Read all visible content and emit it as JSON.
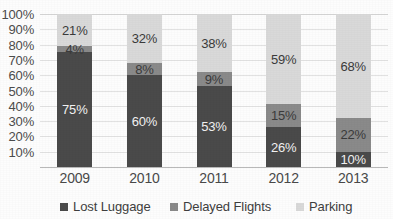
{
  "chart_data": {
    "type": "bar",
    "variant": "stacked-100-percent",
    "title": "",
    "subtitle": "",
    "xlabel": "",
    "ylabel": "",
    "categories": [
      "2009",
      "2010",
      "2011",
      "2012",
      "2013"
    ],
    "series": [
      {
        "name": "Lost Luggage",
        "color": "#4a4a4a",
        "values": [
          75,
          60,
          53,
          26,
          10
        ]
      },
      {
        "name": "Delayed Flights",
        "color": "#8a8a8a",
        "values": [
          4,
          8,
          9,
          15,
          22
        ]
      },
      {
        "name": "Parking",
        "color": "#d9d9d9",
        "values": [
          21,
          32,
          38,
          59,
          68
        ]
      }
    ],
    "data_labels": [
      [
        "75%",
        "60%",
        "53%",
        "26%",
        "10%"
      ],
      [
        "4%",
        "8%",
        "9%",
        "15%",
        "22%"
      ],
      [
        "21%",
        "32%",
        "38%",
        "59%",
        "68%"
      ]
    ],
    "ylim": [
      0,
      100
    ],
    "ytick_labels": [
      "100%",
      "90%",
      "80%",
      "70%",
      "60%",
      "50%",
      "40%",
      "30%",
      "20%",
      "10%"
    ],
    "ytick_values": [
      100,
      90,
      80,
      70,
      60,
      50,
      40,
      30,
      20,
      10
    ],
    "grid": true,
    "legend_position": "bottom"
  },
  "axis": {
    "y_ticks": [
      {
        "label": "100%",
        "value": 100
      },
      {
        "label": "90%",
        "value": 90
      },
      {
        "label": "80%",
        "value": 80
      },
      {
        "label": "70%",
        "value": 70
      },
      {
        "label": "60%",
        "value": 60
      },
      {
        "label": "50%",
        "value": 50
      },
      {
        "label": "40%",
        "value": 40
      },
      {
        "label": "30%",
        "value": 30
      },
      {
        "label": "20%",
        "value": 20
      },
      {
        "label": "10%",
        "value": 10
      }
    ],
    "x_ticks": [
      {
        "label": "2009"
      },
      {
        "label": "2010"
      },
      {
        "label": "2011"
      },
      {
        "label": "2012"
      },
      {
        "label": "2013"
      }
    ]
  },
  "legend": {
    "items": [
      {
        "label": "Lost Luggage",
        "color": "#4a4a4a"
      },
      {
        "label": "Delayed Flights",
        "color": "#8a8a8a"
      },
      {
        "label": "Parking",
        "color": "#d9d9d9"
      }
    ]
  },
  "colors": {
    "lost_luggage": "#4a4a4a",
    "delayed_flights": "#8a8a8a",
    "parking": "#d9d9d9",
    "gridline": "#e2e2e2",
    "axis": "#b9b9b9",
    "background": "#fdfdfd"
  }
}
